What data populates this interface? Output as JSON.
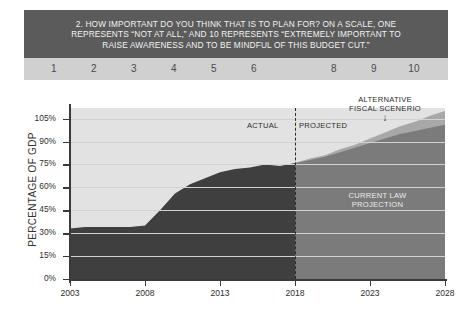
{
  "question": {
    "lines": [
      "2. HOW IMPORTANT DO YOU THINK THAT IS TO PLAN FOR? ON A SCALE, ONE",
      "REPRESENTS “NOT AT ALL,” AND 10 REPRESENTS “EXTREMELY IMPORTANT TO",
      "RAISE AWARENESS AND TO BE MINDFUL OF THIS BUDGET CUT.”"
    ],
    "bar_color": "#5b5b5b",
    "text_color": "#f2f2f2"
  },
  "scale": {
    "bar_color": "#d0d0d0",
    "options": [
      "1",
      "2",
      "3",
      "4",
      "5",
      "6",
      "",
      "8",
      "9",
      "10"
    ]
  },
  "chart_data": {
    "type": "area",
    "title": "",
    "xlabel": "",
    "ylabel": "PERCENTAGE OF GDP",
    "xlim": [
      2003,
      2028
    ],
    "ylim": [
      0,
      112
    ],
    "grid": true,
    "legend": "annotations",
    "yticks": [
      "0%",
      "15%",
      "30%",
      "45%",
      "60%",
      "75%",
      "90%",
      "105%"
    ],
    "ytick_values": [
      0,
      15,
      30,
      45,
      60,
      75,
      90,
      105
    ],
    "xticks": [
      "2003",
      "2008",
      "2013",
      "2018",
      "2023",
      "2028"
    ],
    "xtick_values": [
      2003,
      2008,
      2013,
      2018,
      2023,
      2028
    ],
    "x": [
      2003,
      2004,
      2005,
      2006,
      2007,
      2008,
      2009,
      2010,
      2011,
      2012,
      2013,
      2014,
      2015,
      2016,
      2017,
      2018,
      2019,
      2020,
      2021,
      2022,
      2023,
      2024,
      2025,
      2026,
      2027,
      2028
    ],
    "series": [
      {
        "name": "ACTUAL",
        "color": "#3f3f3f",
        "values": [
          33,
          34,
          34,
          34,
          34,
          35,
          45,
          56,
          62,
          66,
          70,
          72,
          73,
          75,
          74,
          76,
          null,
          null,
          null,
          null,
          null,
          null,
          null,
          null,
          null,
          null
        ]
      },
      {
        "name": "CURRENT LAW PROJECTION",
        "color": "#7b7b7b",
        "values": [
          null,
          null,
          null,
          null,
          null,
          null,
          null,
          null,
          null,
          null,
          null,
          null,
          null,
          null,
          null,
          76,
          78,
          80,
          83,
          86,
          89,
          92,
          95,
          97,
          99,
          101
        ]
      },
      {
        "name": "ALTERNATIVE FISCAL SCENERIO",
        "color": "#a8a8a8",
        "values": [
          null,
          null,
          null,
          null,
          null,
          null,
          null,
          null,
          null,
          null,
          null,
          null,
          null,
          null,
          null,
          76,
          79,
          81,
          85,
          88,
          92,
          96,
          100,
          103,
          107,
          110
        ]
      }
    ],
    "annotations": [
      {
        "id": "actual-label",
        "text": "ACTUAL"
      },
      {
        "id": "projected-label",
        "text": "PROJECTED"
      },
      {
        "id": "alternative-label-line1",
        "text": "ALTERNATIVE"
      },
      {
        "id": "alternative-label-line2",
        "text": "FISCAL SCENERIO"
      },
      {
        "id": "alternative-arrow",
        "text": "↓"
      },
      {
        "id": "current-law-line1",
        "text": "CURRENT LAW"
      },
      {
        "id": "current-law-line2",
        "text": "PROJECTION"
      }
    ],
    "divider_year": 2018,
    "plot_background": "#e2e2e2"
  }
}
